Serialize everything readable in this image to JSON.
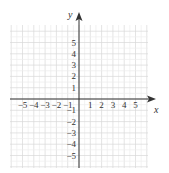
{
  "chart_data": {
    "type": "coordinate-grid",
    "title": "",
    "xlabel": "x",
    "ylabel": "y",
    "xlim": [
      -6,
      6
    ],
    "ylim": [
      -6,
      6
    ],
    "x_ticks": [
      -5,
      -4,
      -3,
      -2,
      -1,
      1,
      2,
      3,
      4,
      5
    ],
    "y_ticks": [
      5,
      4,
      3,
      2,
      1,
      -1,
      -2,
      -3,
      -4,
      -5
    ],
    "x_tick_labels": [
      "−5",
      "−4",
      "−3",
      "−2",
      "−1",
      "1",
      "2",
      "3",
      "4",
      "5"
    ],
    "y_tick_labels": [
      "5",
      "4",
      "3",
      "2",
      "1",
      "−1",
      "−2",
      "−3",
      "−4",
      "−5"
    ],
    "grid": true,
    "grid_subdivisions": 2,
    "points": []
  },
  "colors": {
    "axis": "#333333",
    "grid_major": "#d8d8d8",
    "grid_minor": "#ececec"
  }
}
